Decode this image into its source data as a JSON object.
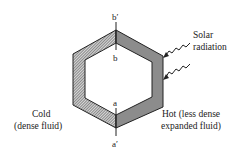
{
  "diagram": {
    "labels": {
      "b_prime": "b′",
      "b": "b",
      "a": "a",
      "a_prime": "a′",
      "solar_line1": "Solar",
      "solar_line2": "radiation",
      "cold_line1": "Cold",
      "cold_line2": "(dense fluid)",
      "hot_line1": "Hot (less dense",
      "hot_line2": "expanded fluid)"
    },
    "regions": {
      "cold_side": "left half of loop (hatched, dense fluid)",
      "hot_side": "right half of loop (shaded, expanded fluid)"
    },
    "colors": {
      "line": "#222222",
      "hot_fill": "#8a8a8a",
      "cold_hatch": "#444444"
    },
    "arrows": [
      {
        "name": "solar-ray-1",
        "meaning": "incoming solar radiation"
      },
      {
        "name": "solar-ray-2",
        "meaning": "incoming solar radiation"
      }
    ]
  }
}
